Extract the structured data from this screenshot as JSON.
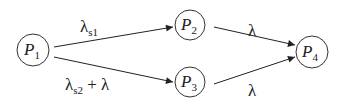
{
  "diagram": {
    "type": "state-transition",
    "nodes": [
      {
        "id": "P1",
        "label": "P",
        "sub": "1"
      },
      {
        "id": "P2",
        "label": "P",
        "sub": "2"
      },
      {
        "id": "P3",
        "label": "P",
        "sub": "3"
      },
      {
        "id": "P4",
        "label": "P",
        "sub": "4"
      }
    ],
    "edges": [
      {
        "from": "P1",
        "to": "P2",
        "label": "λ",
        "sub": "s1",
        "suffix": ""
      },
      {
        "from": "P1",
        "to": "P3",
        "label": "λ",
        "sub": "s2",
        "suffix": " + λ"
      },
      {
        "from": "P2",
        "to": "P4",
        "label": "λ",
        "sub": "",
        "suffix": ""
      },
      {
        "from": "P3",
        "to": "P4",
        "label": "λ",
        "sub": "",
        "suffix": ""
      }
    ]
  }
}
